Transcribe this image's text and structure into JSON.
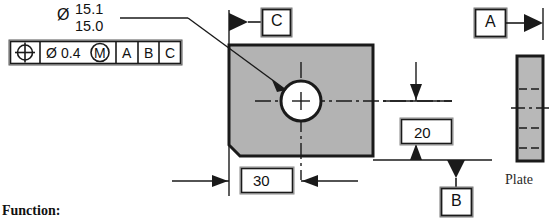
{
  "drawing": {
    "feature_callout": {
      "diameter_symbol": "Ø",
      "upper_limit": "15.1",
      "lower_limit": "15.0"
    },
    "feature_control_frame": {
      "geometric_symbol": "position-symbol",
      "diameter_symbol": "Ø",
      "tolerance_value": "0.4",
      "material_modifier": "M",
      "datum_primary": "A",
      "datum_secondary": "B",
      "datum_tertiary": "C"
    },
    "datum_features": [
      {
        "name": "datum-c",
        "label": "C"
      },
      {
        "name": "datum-a",
        "label": "A"
      },
      {
        "name": "datum-b",
        "label": "B"
      }
    ],
    "dimensions": [
      {
        "name": "horizontal-basic-dimension",
        "value": "30"
      },
      {
        "name": "vertical-basic-dimension",
        "value": "20"
      }
    ],
    "side_view": {
      "label": "Plate"
    },
    "colors": {
      "part_fill": "#b3b3b3",
      "plate_fill": "#b8b8b8",
      "line": "#1a1a1a",
      "hole_fill": "#ffffff",
      "box_fill": "#f0f0f0"
    }
  },
  "footer": {
    "function_label": "Function:"
  }
}
